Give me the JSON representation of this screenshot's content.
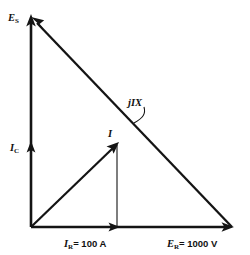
{
  "diagram": {
    "type": "phasor-diagram",
    "title": "",
    "background_color": "#ffffff",
    "line_color": "#141414",
    "labels": {
      "es": {
        "symbol": "E",
        "subscript": "S",
        "full": "E_S"
      },
      "ic": {
        "symbol": "I",
        "subscript": "C",
        "full": "I_C"
      },
      "current": {
        "symbol": "I",
        "subscript": "",
        "full": "I"
      },
      "jix": {
        "symbol": "jIX",
        "subscript": "",
        "full": "jIX"
      },
      "ir": {
        "symbol": "I",
        "subscript": "R",
        "value": "=  100 A",
        "full": "I_R = 100 A"
      },
      "er": {
        "symbol": "E",
        "subscript": "R",
        "value": "=  1000 V",
        "full": "E_R = 1000 V"
      }
    },
    "vectors": [
      {
        "name": "E_S",
        "from": [
          31,
          227
        ],
        "to": [
          31,
          17
        ],
        "arrow_at": "end",
        "description": "source voltage, vertical upward"
      },
      {
        "name": "I_C",
        "from": [
          31,
          227
        ],
        "to": [
          31,
          145
        ],
        "arrow_at": "end",
        "description": "capacitor current, vertical upward midpoint arrowhead"
      },
      {
        "name": "jIX",
        "from": [
          232,
          227
        ],
        "to": [
          31,
          17
        ],
        "arrow_at": "end",
        "description": "reactive voltage drop, hypotenuse pointing up-left"
      },
      {
        "name": "E_R",
        "from": [
          31,
          227
        ],
        "to": [
          232,
          227
        ],
        "arrow_at": "end",
        "description": "resistive voltage, horizontal rightward"
      },
      {
        "name": "I",
        "from": [
          31,
          227
        ],
        "to": [
          118,
          143
        ],
        "arrow_at": "end",
        "description": "total current, diagonal up-right"
      },
      {
        "name": "I_R",
        "from": [
          31,
          227
        ],
        "to": [
          117,
          227
        ],
        "arrow_at": "end",
        "description": "resistive current, horizontal to 100 A mark"
      }
    ],
    "construction_lines": [
      {
        "name": "I-projection",
        "from": [
          117,
          145
        ],
        "to": [
          117,
          227
        ],
        "style": "thin",
        "description": "drop line from I tip to baseline"
      }
    ],
    "leader": {
      "name": "jIX-leader",
      "from": [
        143,
        108
      ],
      "to": [
        133,
        123
      ],
      "description": "curved pointer from jIX label to hypotenuse"
    }
  }
}
